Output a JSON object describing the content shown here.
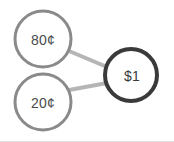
{
  "diagram": {
    "type": "number-bond",
    "title": "",
    "canvas": {
      "width": 174,
      "height": 142,
      "background": "#ffffff"
    },
    "colors": {
      "part_stroke": "#8a8a8a",
      "total_stroke": "#3a3a3a",
      "connector": "#b5b5b5",
      "part_text": "#4a4a4a",
      "total_text": "#3a3a3a",
      "canvas_background": "#ffffff",
      "bottom_edge": "#e2e2e2"
    },
    "nodes": [
      {
        "id": "part-top",
        "role": "part",
        "label": "80¢",
        "value": 80,
        "unit": "cent",
        "cx": 43,
        "cy": 39,
        "r": 28,
        "stroke": "#8a8a8a",
        "stroke_width": 3
      },
      {
        "id": "part-bottom",
        "role": "part",
        "label": "20¢",
        "value": 20,
        "unit": "cent",
        "cx": 43,
        "cy": 102,
        "r": 28,
        "stroke": "#8a8a8a",
        "stroke_width": 3
      },
      {
        "id": "total",
        "role": "total",
        "label": "$1",
        "value": 1,
        "unit": "dollar",
        "cx": 131,
        "cy": 75,
        "r": 26,
        "stroke": "#3a3a3a",
        "stroke_width": 4
      }
    ],
    "connectors": [
      {
        "id": "connector-top",
        "from": "part-top",
        "to": "total",
        "x1": 69,
        "y1": 51,
        "x2": 107,
        "y2": 67,
        "stroke": "#b5b5b5",
        "stroke_width": 4
      },
      {
        "id": "connector-bottom",
        "from": "part-bottom",
        "to": "total",
        "x1": 69,
        "y1": 90,
        "x2": 107,
        "y2": 83,
        "stroke": "#b5b5b5",
        "stroke_width": 4
      }
    ]
  }
}
